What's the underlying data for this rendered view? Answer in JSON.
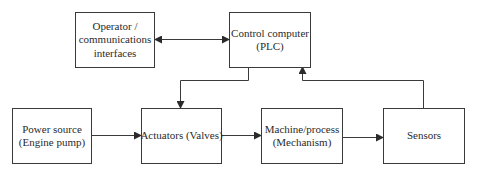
{
  "diagram": {
    "type": "block-diagram",
    "colors": {
      "line": "#3a3a3a",
      "text": "#2b2b2b",
      "background": "#ffffff"
    },
    "nodes": {
      "operator": {
        "lines": [
          "Operator /",
          "communications",
          "interfaces"
        ]
      },
      "plc": {
        "lines": [
          "Control computer",
          "(PLC)"
        ]
      },
      "power": {
        "lines": [
          "Power source",
          "(Engine pump)"
        ]
      },
      "actuators": {
        "lines": [
          "Actuators (Valves)"
        ]
      },
      "machine": {
        "lines": [
          "Machine/process",
          "(Mechanism)"
        ]
      },
      "sensors": {
        "lines": [
          "Sensors"
        ]
      }
    },
    "edges": [
      {
        "from": "operator",
        "to": "plc",
        "bidirectional": true
      },
      {
        "from": "plc",
        "to": "actuators"
      },
      {
        "from": "power",
        "to": "actuators"
      },
      {
        "from": "actuators",
        "to": "machine"
      },
      {
        "from": "machine",
        "to": "sensors"
      },
      {
        "from": "sensors",
        "to": "plc"
      }
    ]
  }
}
